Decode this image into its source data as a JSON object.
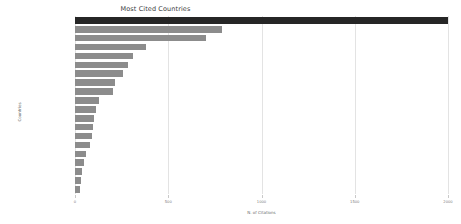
{
  "chart_data": {
    "type": "bar",
    "orientation": "horizontal",
    "title": "Most Cited Countries",
    "xlabel": "N. of Citations",
    "ylabel": "Countries",
    "xlim": [
      0,
      2000
    ],
    "xticks": [
      0,
      500,
      1000,
      1500,
      2000
    ],
    "xtick_labels": [
      "0",
      "500",
      "1000",
      "1500",
      "2000"
    ],
    "grid": true,
    "legend": "none",
    "categories": [
      "USA",
      "UNITED KINGDOM",
      "AUSTRALIA",
      "NETHERLANDS",
      "AUSTRIA",
      "ITALY",
      "CANADA",
      "CHINA",
      "SPAIN",
      "SOUTH AFRICA",
      "NORWAY",
      "SWEDEN",
      "GERMANY",
      "PORTUGAL",
      "ISRAEL",
      "DENMARK",
      "IRELAND",
      "BRAZIL",
      "GREECE",
      "INDIA"
    ],
    "values": [
      2000,
      790,
      700,
      380,
      310,
      285,
      260,
      215,
      205,
      130,
      110,
      100,
      95,
      90,
      80,
      60,
      50,
      40,
      32,
      25
    ],
    "bar_colors": [
      "#262626",
      "#8c8c8c",
      "#8c8c8c",
      "#8c8c8c",
      "#8c8c8c",
      "#8c8c8c",
      "#8c8c8c",
      "#8c8c8c",
      "#8c8c8c",
      "#8c8c8c",
      "#8c8c8c",
      "#8c8c8c",
      "#8c8c8c",
      "#8c8c8c",
      "#8c8c8c",
      "#8c8c8c",
      "#8c8c8c",
      "#8c8c8c",
      "#8c8c8c",
      "#8c8c8c"
    ],
    "highlight_color": "#262626",
    "bar_color": "#8c8c8c",
    "grid_color": "#e3e3e3",
    "background": "#ffffff"
  }
}
